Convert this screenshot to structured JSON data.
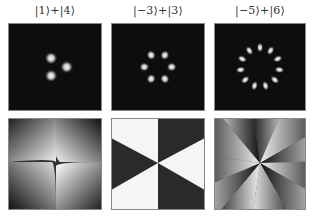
{
  "figure": {
    "columns": [
      {
        "label": "|1⟩+|4⟩",
        "lobes": 3,
        "ring_radius": 9,
        "phase_sectors": 3
      },
      {
        "label": "|−3⟩+|3⟩",
        "lobes": 6,
        "ring_radius": 16,
        "phase_sectors": 6
      },
      {
        "label": "|−5⟩+|6⟩",
        "lobes": 11,
        "ring_radius": 22,
        "phase_sectors": 11
      }
    ],
    "rows": [
      "intensity",
      "phase"
    ],
    "colors": {
      "background": "#0d0d0d",
      "lobe": "#ffffff",
      "phase_dark": "#1a1a1a",
      "phase_light": "#f5f5f5"
    }
  }
}
